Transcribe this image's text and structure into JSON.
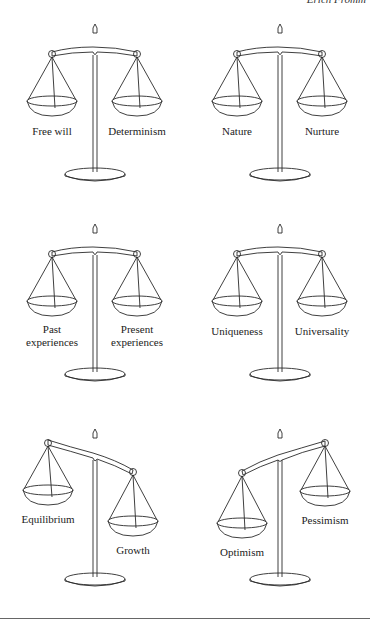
{
  "header": {
    "running_title": "Erich Fromm"
  },
  "scales": [
    {
      "id": "free-will-determinism",
      "left": "Free will",
      "right": "Determinism",
      "tilt": "balanced"
    },
    {
      "id": "nature-nurture",
      "left": "Nature",
      "right": "Nurture",
      "tilt": "balanced"
    },
    {
      "id": "past-present",
      "left": "Past\nexperiences",
      "left_l1": "Past",
      "left_l2": "experiences",
      "right_l1": "Present",
      "right_l2": "experiences",
      "tilt": "balanced"
    },
    {
      "id": "uniqueness-universality",
      "left": "Uniqueness",
      "right": "Universality",
      "tilt": "balanced"
    },
    {
      "id": "equilibrium-growth",
      "left": "Equilibrium",
      "right": "Growth",
      "tilt": "right-down"
    },
    {
      "id": "optimism-pessimism",
      "left": "Optimism",
      "right": "Pessimism",
      "tilt": "left-down"
    }
  ],
  "colors": {
    "line": "#2a2a2a",
    "background": "#ffffff",
    "rule": "#666666"
  }
}
